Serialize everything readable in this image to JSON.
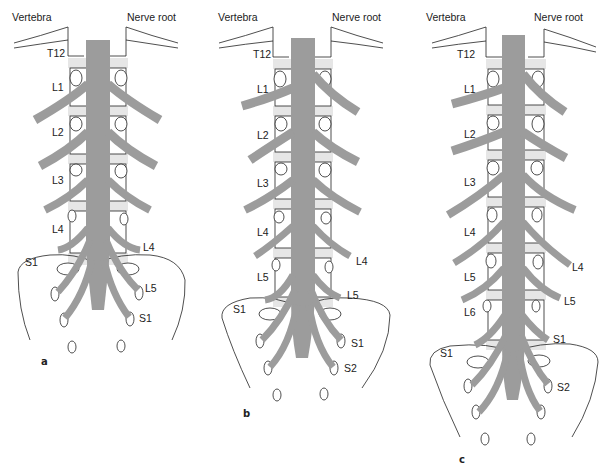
{
  "figure": {
    "colors": {
      "nerve_gray": "#9c9c9c",
      "disc_gray": "#e6e6e6",
      "outline": "#222222",
      "background": "#ffffff"
    },
    "panels": [
      {
        "id": "a",
        "panel_label": "a",
        "header_left": "Vertebra",
        "header_right": "Nerve root",
        "top_label": "T12",
        "vertebra_labels": [
          "L1",
          "L2",
          "L3",
          "L4"
        ],
        "sacrum_label": "S1",
        "nerve_root_labels": [
          "L4",
          "L5",
          "S1"
        ]
      },
      {
        "id": "b",
        "panel_label": "b",
        "header_left": "Vertebra",
        "header_right": "Nerve root",
        "top_label": "T12",
        "vertebra_labels": [
          "L1",
          "L2",
          "L3",
          "L4",
          "L5"
        ],
        "sacrum_label": "S1",
        "nerve_root_labels": [
          "L4",
          "L5",
          "S1",
          "S2"
        ]
      },
      {
        "id": "c",
        "panel_label": "c",
        "header_left": "Vertebra",
        "header_right": "Nerve root",
        "top_label": "T12",
        "vertebra_labels": [
          "L1",
          "L2",
          "L3",
          "L4",
          "L5",
          "L6"
        ],
        "sacrum_label": "S1",
        "nerve_root_labels": [
          "L4",
          "L5",
          "S1",
          "S2"
        ]
      }
    ]
  }
}
